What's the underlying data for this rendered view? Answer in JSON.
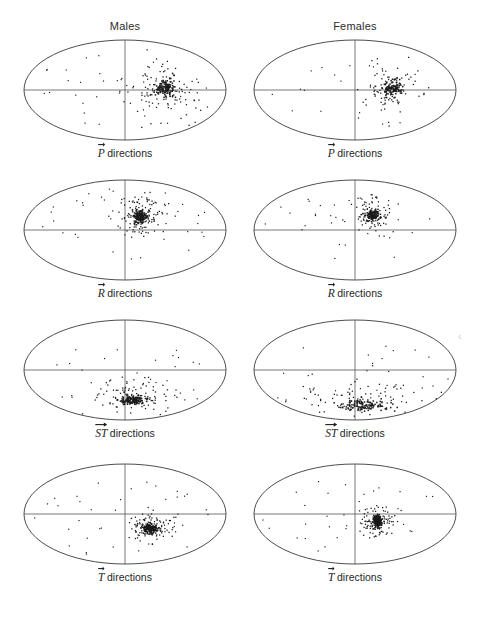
{
  "figure": {
    "type": "scatter-grid",
    "background": "#ffffff",
    "ink_color": "#1a1a1a",
    "outline_color": "#3a3a3a"
  },
  "columns": [
    {
      "id": "males",
      "label": "Males",
      "cx": 125
    },
    {
      "id": "females",
      "label": "Females",
      "cx": 355
    }
  ],
  "rows": [
    {
      "id": "p",
      "symbol": "P",
      "label_suffix": "directions"
    },
    {
      "id": "r",
      "symbol": "R",
      "label_suffix": "directions"
    },
    {
      "id": "st",
      "symbol": "ST",
      "label_suffix": "directions"
    },
    {
      "id": "t",
      "symbol": "T",
      "label_suffix": "directions"
    }
  ],
  "chart_data": {
    "type": "scatter",
    "title": "",
    "xlabel": "",
    "ylabel": "",
    "projection": "ellipse",
    "axis_lines": [
      "horizontal",
      "vertical"
    ],
    "grid": false,
    "legend": null,
    "panels": [
      {
        "id": "p-males",
        "column": "Males",
        "row": "P",
        "label": "P directions",
        "n_points": 268,
        "cluster_center": [
          0.34,
          0.02
        ],
        "cluster_spread": [
          0.17,
          0.3
        ],
        "dense_core": [
          0.39,
          0.05
        ],
        "seed": 11
      },
      {
        "id": "p-females",
        "column": "Females",
        "row": "P",
        "label": "P directions",
        "n_points": 214,
        "cluster_center": [
          0.33,
          0.02
        ],
        "cluster_spread": [
          0.15,
          0.28
        ],
        "dense_core": [
          0.37,
          0.04
        ],
        "seed": 23
      },
      {
        "id": "r-males",
        "column": "Males",
        "row": "R",
        "label": "R directions",
        "n_points": 300,
        "cluster_center": [
          0.16,
          0.3
        ],
        "cluster_spread": [
          0.11,
          0.19
        ],
        "dense_core": [
          0.15,
          0.27
        ],
        "seed": 37
      },
      {
        "id": "r-females",
        "column": "Females",
        "row": "R",
        "label": "R directions",
        "n_points": 236,
        "cluster_center": [
          0.17,
          0.33
        ],
        "cluster_spread": [
          0.1,
          0.18
        ],
        "dense_core": [
          0.17,
          0.31
        ],
        "seed": 53
      },
      {
        "id": "st-males",
        "column": "Males",
        "row": "ST",
        "label": "ST directions",
        "n_points": 262,
        "cluster_center": [
          0.1,
          -0.52
        ],
        "cluster_spread": [
          0.19,
          0.16
        ],
        "dense_core": [
          0.07,
          -0.6
        ],
        "seed": 71
      },
      {
        "id": "st-females",
        "column": "Females",
        "row": "ST",
        "label": "ST directions",
        "n_points": 232,
        "cluster_center": [
          0.0,
          -0.55
        ],
        "cluster_spread": [
          0.4,
          0.2
        ],
        "dense_core": [
          0.1,
          -0.7
        ],
        "seed": 89
      },
      {
        "id": "t-males",
        "column": "Males",
        "row": "T",
        "label": "T directions",
        "n_points": 340,
        "cluster_center": [
          0.26,
          -0.26
        ],
        "cluster_spread": [
          0.1,
          0.13
        ],
        "dense_core": [
          0.25,
          -0.28
        ],
        "seed": 101
      },
      {
        "id": "t-females",
        "column": "Females",
        "row": "T",
        "label": "T directions",
        "n_points": 300,
        "cluster_center": [
          0.22,
          -0.16
        ],
        "cluster_spread": [
          0.08,
          0.18
        ],
        "dense_core": [
          0.22,
          -0.14
        ],
        "seed": 127
      }
    ]
  }
}
